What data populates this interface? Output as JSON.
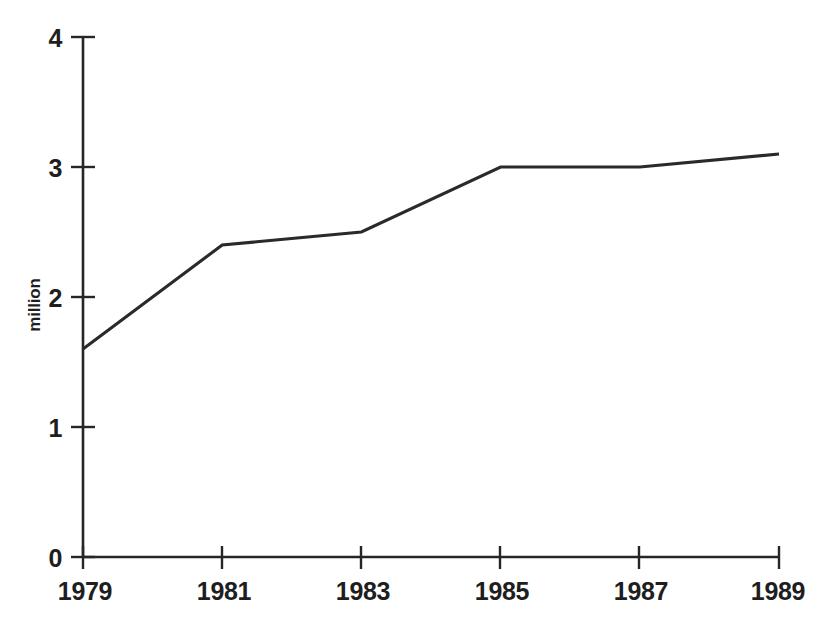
{
  "chart_data": {
    "type": "line",
    "title": "",
    "subtitle": "",
    "xlabel": "",
    "ylabel": "million",
    "categories": [
      "1979",
      "1981",
      "1983",
      "1985",
      "1987",
      "1989"
    ],
    "x": [
      1979,
      1981,
      1983,
      1985,
      1987,
      1989
    ],
    "values": [
      1.6,
      2.4,
      2.5,
      3.0,
      3.0,
      3.1
    ],
    "series": [
      {
        "name": "million",
        "values": [
          1.6,
          2.4,
          2.5,
          3.0,
          3.0,
          3.1
        ]
      }
    ],
    "xlim": [
      1979,
      1989
    ],
    "ylim": [
      0,
      4
    ],
    "y_ticks": [
      "0",
      "1",
      "2",
      "3",
      "4"
    ],
    "y_tick_values": [
      0,
      1,
      2,
      3,
      4
    ],
    "x_ticks": [
      "1979",
      "1981",
      "1983",
      "1985",
      "1987",
      "1989"
    ],
    "grid": false,
    "legend": false,
    "legend_position": "none",
    "line_color": "#2a2a2a",
    "axis_color": "#262626",
    "background_color": "#ffffff"
  },
  "axes": {
    "y_axis_title": "million",
    "y_tick_labels": [
      "4",
      "3",
      "2",
      "1",
      "0"
    ],
    "x_tick_labels": [
      "1979",
      "1981",
      "1983",
      "1985",
      "1987",
      "1989"
    ]
  }
}
